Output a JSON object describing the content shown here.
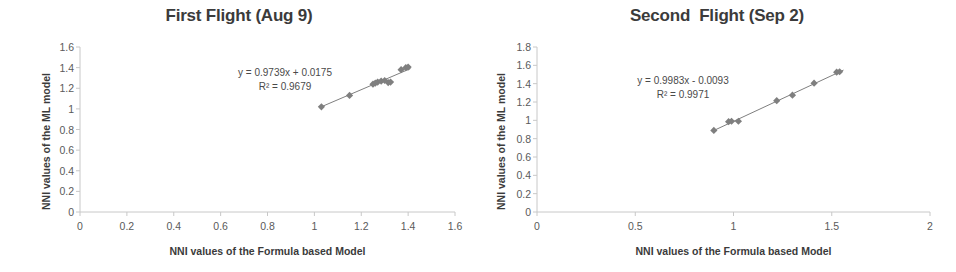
{
  "figure": {
    "width": 956,
    "height": 272,
    "background": "#ffffff",
    "marker_color": "#7f7f7f",
    "trendline_color": "#7f7f7f",
    "axis_color": "#c8c8c8",
    "text_color": "#3b3b3b"
  },
  "chart_data": [
    {
      "type": "scatter",
      "title": "First Flight (Aug 9)",
      "xlabel": "NNI values of the Formula based Model",
      "ylabel": "NNI values of the ML model",
      "xlim": [
        0,
        1.6
      ],
      "ylim": [
        0,
        1.6
      ],
      "xticks": [
        "0",
        "0.2",
        "0.4",
        "0.6",
        "0.8",
        "1",
        "1.2",
        "1.4",
        "1.6"
      ],
      "xtick_values": [
        0,
        0.2,
        0.4,
        0.6,
        0.8,
        1.0,
        1.2,
        1.4,
        1.6
      ],
      "yticks": [
        "0",
        "0.2",
        "0.4",
        "0.6",
        "0.8",
        "1",
        "1.2",
        "1.4",
        "1.6"
      ],
      "ytick_values": [
        0,
        0.2,
        0.4,
        0.6,
        0.8,
        1.0,
        1.2,
        1.4,
        1.6
      ],
      "grid": false,
      "legend": "none",
      "annotations": {
        "equation": "y = 0.9739x + 0.0175",
        "r_squared": "R² = 0.9679"
      },
      "trendline": {
        "slope": 0.9739,
        "intercept": 0.0175,
        "x_start": 1.02,
        "x_end": 1.41
      },
      "points": [
        {
          "x": 1.03,
          "y": 1.02
        },
        {
          "x": 1.15,
          "y": 1.13
        },
        {
          "x": 1.25,
          "y": 1.24
        },
        {
          "x": 1.26,
          "y": 1.25
        },
        {
          "x": 1.27,
          "y": 1.26
        },
        {
          "x": 1.285,
          "y": 1.27
        },
        {
          "x": 1.3,
          "y": 1.275
        },
        {
          "x": 1.315,
          "y": 1.255
        },
        {
          "x": 1.325,
          "y": 1.26
        },
        {
          "x": 1.37,
          "y": 1.38
        },
        {
          "x": 1.39,
          "y": 1.4
        },
        {
          "x": 1.4,
          "y": 1.405
        }
      ]
    },
    {
      "type": "scatter",
      "title": "Second  Flight (Sep 2)",
      "xlabel": "NNI values of the Formula based Model",
      "ylabel": "NNI values of the ML model",
      "xlim": [
        0,
        2
      ],
      "ylim": [
        0,
        1.8
      ],
      "xticks": [
        "0",
        "0.5",
        "1",
        "1.5",
        "2"
      ],
      "xtick_values": [
        0,
        0.5,
        1.0,
        1.5,
        2.0
      ],
      "yticks": [
        "0",
        "0.2",
        "0.4",
        "0.6",
        "0.8",
        "1",
        "1.2",
        "1.4",
        "1.6",
        "1.8"
      ],
      "ytick_values": [
        0,
        0.2,
        0.4,
        0.6,
        0.8,
        1.0,
        1.2,
        1.4,
        1.6,
        1.8
      ],
      "grid": false,
      "legend": "none",
      "annotations": {
        "equation": "y = 0.9983x - 0.0093",
        "r_squared": "R² = 0.9971"
      },
      "trendline": {
        "slope": 0.9983,
        "intercept": -0.0093,
        "x_start": 0.89,
        "x_end": 1.56
      },
      "points": [
        {
          "x": 0.9,
          "y": 0.89
        },
        {
          "x": 0.975,
          "y": 0.985
        },
        {
          "x": 0.99,
          "y": 0.99
        },
        {
          "x": 1.025,
          "y": 0.99
        },
        {
          "x": 1.22,
          "y": 1.215
        },
        {
          "x": 1.3,
          "y": 1.275
        },
        {
          "x": 1.41,
          "y": 1.405
        },
        {
          "x": 1.525,
          "y": 1.525
        },
        {
          "x": 1.54,
          "y": 1.53
        }
      ]
    }
  ]
}
